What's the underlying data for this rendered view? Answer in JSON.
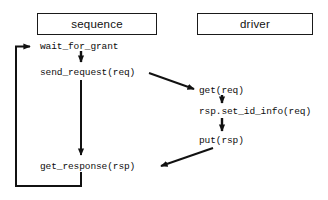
{
  "diagram": {
    "title_lanes": [
      {
        "id": "sequence",
        "label": "sequence"
      },
      {
        "id": "driver",
        "label": "driver"
      }
    ],
    "sequence_steps": [
      {
        "id": "wait-for-grant",
        "label": "wait_for_grant"
      },
      {
        "id": "send-request",
        "label": "send_request(req)"
      },
      {
        "id": "get-response",
        "label": "get_response(rsp)"
      }
    ],
    "driver_steps": [
      {
        "id": "get-req",
        "label": "get(req)"
      },
      {
        "id": "rsp-set-id-info",
        "label": "rsp.set_id_info(req)"
      },
      {
        "id": "put-rsp",
        "label": "put(rsp)"
      }
    ],
    "edges": [
      {
        "id": "wait-to-send",
        "kind": "vertical-arrow"
      },
      {
        "id": "send-to-get-response",
        "kind": "vertical-arrow"
      },
      {
        "id": "send-to-get-req",
        "kind": "diagonal-arrow"
      },
      {
        "id": "get-req-to-set-id-info",
        "kind": "vertical-arrow"
      },
      {
        "id": "set-id-info-to-put",
        "kind": "vertical-arrow"
      },
      {
        "id": "put-to-get-response",
        "kind": "diagonal-arrow"
      },
      {
        "id": "get-response-loop-back",
        "kind": "feedback-loop-arrow"
      }
    ],
    "colors": {
      "background": "#ffffff",
      "stroke": "#111111",
      "box_border": "#1a1a1a",
      "text": "#0d0d0d"
    }
  }
}
